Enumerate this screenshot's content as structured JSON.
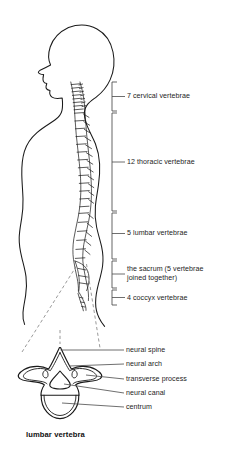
{
  "figure": {
    "background_color": "#ffffff",
    "ink_color": "#1a1a1a",
    "leader_color": "#4a4a4a",
    "dashed_color": "#777777"
  },
  "spine_regions": [
    {
      "id": "cervical",
      "label": "7 cervical vertebrae",
      "count": 7,
      "bracket": {
        "x": 112,
        "top": 82,
        "bottom": 111,
        "tick": 5
      },
      "label_pos": {
        "x": 127,
        "y": 92
      }
    },
    {
      "id": "thoracic",
      "label": "12 thoracic vertebrae",
      "count": 12,
      "bracket": {
        "x": 112,
        "top": 113,
        "bottom": 211,
        "tick": 5
      },
      "label_pos": {
        "x": 127,
        "y": 158
      }
    },
    {
      "id": "lumbar",
      "label": "5 lumbar vertebrae",
      "count": 5,
      "bracket": {
        "x": 112,
        "top": 213,
        "bottom": 259,
        "tick": 5
      },
      "label_pos": {
        "x": 127,
        "y": 229
      }
    },
    {
      "id": "sacrum",
      "label": "the sacrum (5 vertebrae\njoined together)",
      "count": 5,
      "bracket": {
        "x": 112,
        "top": 261,
        "bottom": 288,
        "tick": 5
      },
      "label_pos": {
        "x": 127,
        "y": 265
      }
    },
    {
      "id": "coccyx",
      "label": "4 coccyx vertebrae",
      "count": 4,
      "bracket": {
        "x": 112,
        "top": 290,
        "bottom": 305,
        "tick": 5
      },
      "label_pos": {
        "x": 127,
        "y": 294
      }
    }
  ],
  "vertebra_parts": [
    {
      "id": "neural-spine",
      "label": "neural spine",
      "label_pos": {
        "x": 126,
        "y": 348
      }
    },
    {
      "id": "neural-arch",
      "label": "neural arch",
      "label_pos": {
        "x": 126,
        "y": 362
      }
    },
    {
      "id": "transverse-process",
      "label": "transverse process",
      "label_pos": {
        "x": 126,
        "y": 377
      }
    },
    {
      "id": "neural-canal",
      "label": "neural canal",
      "label_pos": {
        "x": 126,
        "y": 391
      }
    },
    {
      "id": "centrum",
      "label": "centrum",
      "label_pos": {
        "x": 126,
        "y": 405
      }
    }
  ],
  "detail_caption": {
    "text": "lumbar vertebra",
    "pos": {
      "x": 26,
      "y": 432
    }
  }
}
